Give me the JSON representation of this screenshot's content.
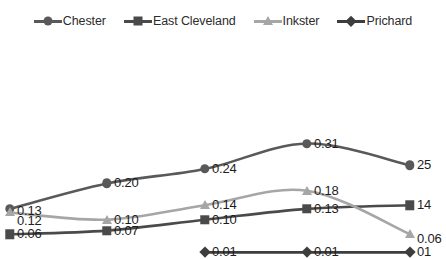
{
  "chart_data": {
    "type": "line",
    "title": "",
    "subtitle": "",
    "xlabel": "",
    "ylabel": "",
    "x": [
      1,
      2,
      3,
      4,
      5
    ],
    "categories": [
      "",
      "",
      "",
      "",
      ""
    ],
    "xtick_labels": [],
    "ytick_labels": [],
    "ylim": [
      0.0,
      0.35
    ],
    "grid": false,
    "axes_visible": false,
    "legend_position": "top",
    "data_labels": true,
    "smoothing": "spline",
    "series": [
      {
        "name": "Chester",
        "color": "#595959",
        "marker": "circle",
        "values": [
          0.13,
          0.2,
          0.24,
          0.31,
          0.25
        ],
        "labels": [
          "0.13",
          "0.20",
          "0.24",
          "0.31",
          "0.25"
        ],
        "label_display": [
          "0.13",
          "0.20",
          "0.24",
          "0.31",
          "25"
        ]
      },
      {
        "name": "East Cleveland",
        "color": "#4a4a4a",
        "marker": "square",
        "values": [
          0.06,
          0.07,
          0.1,
          0.13,
          0.14
        ],
        "labels": [
          "0.06",
          "0.07",
          "0.10",
          "0.13",
          "0.14"
        ],
        "label_display": [
          "0.06",
          "0.07",
          "0.10",
          "0.13",
          "14"
        ]
      },
      {
        "name": "Inkster",
        "color": "#a6a6a6",
        "marker": "triangle",
        "values": [
          0.12,
          0.1,
          0.14,
          0.18,
          0.06
        ],
        "labels": [
          "0.12",
          "0.10",
          "0.14",
          "0.18",
          "0.06"
        ],
        "label_display": [
          "0.12",
          "0.10",
          "0.14",
          "0.18",
          "0.06"
        ]
      },
      {
        "name": "Prichard",
        "color": "#3d3d3d",
        "marker": "diamond",
        "values": [
          null,
          null,
          0.01,
          0.01,
          0.01
        ],
        "labels": [
          "",
          "",
          "0.01",
          "0.01",
          "0.01"
        ],
        "label_display": [
          "",
          "",
          "0.01",
          "0.01",
          "01"
        ]
      }
    ]
  },
  "legend": {
    "items": [
      {
        "label": "Chester",
        "color": "#595959",
        "marker": "circle"
      },
      {
        "label": "East Cleveland",
        "color": "#4a4a4a",
        "marker": "square"
      },
      {
        "label": "Inkster",
        "color": "#a6a6a6",
        "marker": "triangle"
      },
      {
        "label": "Prichard",
        "color": "#3d3d3d",
        "marker": "diamond"
      }
    ]
  }
}
